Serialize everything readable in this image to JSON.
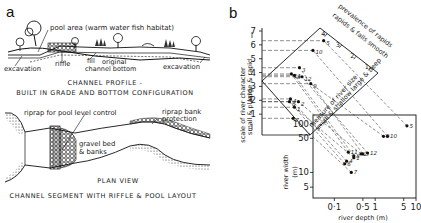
{
  "panel_a": {
    "letter": "a",
    "profile": {
      "labels": {
        "pool_area": "pool area (warm water fish habitat)",
        "excavation_left": "excavation",
        "riffle": "riffle",
        "fill": "fill",
        "original_bottom": "original",
        "original_bottom_2": "channel bottom",
        "excavation_right": "excavation"
      },
      "caption_line1": "CHANNEL PROFILE -",
      "caption_line2": "BUILT IN GRADE AND BOTTOM CONFIGURATION"
    },
    "plan": {
      "labels": {
        "riprap_pool": "riprap for pool level control",
        "riprap_bank_1": "riprap bank",
        "riprap_bank_2": "protection",
        "gravel_1": "gravel bed",
        "gravel_2": "& banks"
      },
      "title": "PLAN VIEW",
      "caption": "CHANNEL SEGMENT WITH RIFFLE & POOL LAYOUT"
    }
  },
  "panel_b": {
    "letter": "b",
    "scale_axis": {
      "label_line1": "scale of river character",
      "label_line2_left": "small & placid",
      "label_line2_right": "large & rapid",
      "ticks": [
        "1",
        "2",
        "3",
        "4",
        "5",
        "6",
        "7"
      ]
    },
    "rapids_axis": {
      "label": "prevalence of rapids",
      "sublabel": "rapids & falls   smooth",
      "ticks": [
        "1",
        "2",
        "3",
        "4"
      ]
    },
    "size_axis": {
      "label": "measure of river size",
      "sublabel": "small & shallow   large & deep"
    },
    "width_axis": {
      "label": "river width",
      "unit": "(m)",
      "ticks": [
        "5",
        "10",
        "50",
        "100"
      ]
    },
    "depth_axis": {
      "label": "river depth (m)",
      "ticks": [
        "0·1",
        "0·5",
        "1",
        "5",
        "10"
      ]
    }
  },
  "chart_data": {
    "type": "scatter",
    "title": "",
    "xlabel": "river depth (m)",
    "ylabel": "river width (m)",
    "xscale": "log",
    "yscale": "log",
    "xlim": [
      0.03,
      10
    ],
    "ylim": [
      3,
      150
    ],
    "xticks": [
      0.1,
      0.5,
      1,
      5,
      10
    ],
    "yticks": [
      5,
      10,
      50,
      100
    ],
    "points": [
      {
        "id": "5",
        "depth": 6.0,
        "width": 90,
        "scale": 6.3
      },
      {
        "id": "10",
        "depth": 2.0,
        "width": 55,
        "scale": 5.6
      },
      {
        "id": "9",
        "depth": 1.6,
        "width": 55,
        "scale": 3.2
      },
      {
        "id": "12",
        "depth": 0.65,
        "width": 25,
        "scale": 3.7
      },
      {
        "id": "3",
        "depth": 0.5,
        "width": 24,
        "scale": 4.35
      },
      {
        "id": "11",
        "depth": 0.22,
        "width": 26,
        "scale": 3.9
      },
      {
        "id": "8",
        "depth": 0.3,
        "width": 22,
        "scale": 3.8
      },
      {
        "id": "2",
        "depth": 0.45,
        "width": 24,
        "scale": 1.9
      },
      {
        "id": "1",
        "depth": 0.3,
        "width": 20,
        "scale": 1.5
      },
      {
        "id": "4",
        "depth": 0.2,
        "width": 17,
        "scale": 2.1
      },
      {
        "id": "6",
        "depth": 0.18,
        "width": 15,
        "scale": 1.9
      },
      {
        "id": "7",
        "depth": 0.26,
        "width": 10,
        "scale": 0.7
      }
    ],
    "secondary_axis": {
      "label": "scale of river character",
      "ylim": [
        0,
        7
      ],
      "ticks": [
        1,
        2,
        3,
        4,
        5,
        6,
        7
      ]
    },
    "rapids_scale": {
      "label": "prevalence of rapids",
      "ticks": [
        1,
        2,
        3,
        4
      ]
    }
  }
}
